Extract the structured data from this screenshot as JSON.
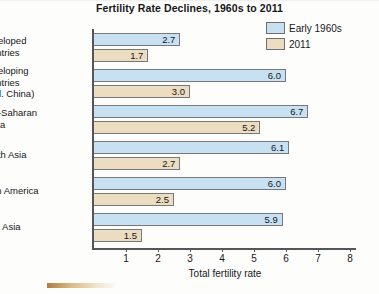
{
  "chart_data": {
    "type": "bar",
    "orientation": "horizontal",
    "title": "Fertility Rate Declines, 1960s to 2011",
    "xlabel": "Total fertility rate",
    "ylabel": "",
    "xlim": [
      0,
      8.6
    ],
    "xticks": [
      1,
      2,
      3,
      4,
      5,
      6,
      7,
      8
    ],
    "grid": false,
    "legend_position": "top-right",
    "categories": [
      "Developed countries",
      "Developing countries (excl. China)",
      "Sub-Saharan Africa",
      "South Asia",
      "Latin America",
      "East Asia"
    ],
    "category_lines": [
      [
        "Developed",
        "countries"
      ],
      [
        "Developing",
        "countries",
        "(excl. China)"
      ],
      [
        "Sub-Saharan",
        "Africa"
      ],
      [
        "South Asia"
      ],
      [
        "Latin America"
      ],
      [
        "East Asia"
      ]
    ],
    "series": [
      {
        "name": "Early 1960s",
        "color": "#c7e0f2",
        "values": [
          2.7,
          6.0,
          6.7,
          6.1,
          6.0,
          5.9
        ],
        "labels": [
          "2.7",
          "6.0",
          "6.7",
          "6.1",
          "6.0",
          "5.9"
        ]
      },
      {
        "name": "2011",
        "color": "#ecdcc0",
        "values": [
          1.7,
          3.0,
          5.2,
          2.7,
          2.5,
          1.5
        ],
        "labels": [
          "1.7",
          "3.0",
          "5.2",
          "2.7",
          "2.5",
          "1.5"
        ]
      }
    ]
  },
  "legend": {
    "items": [
      {
        "label": "Early 1960s",
        "color": "#c7e0f2"
      },
      {
        "label": "2011",
        "color": "#ecdcc0"
      }
    ]
  },
  "axis": {
    "tick_labels": [
      "1",
      "2",
      "3",
      "4",
      "5",
      "6",
      "7",
      "8"
    ],
    "x_title": "Total fertility rate"
  }
}
